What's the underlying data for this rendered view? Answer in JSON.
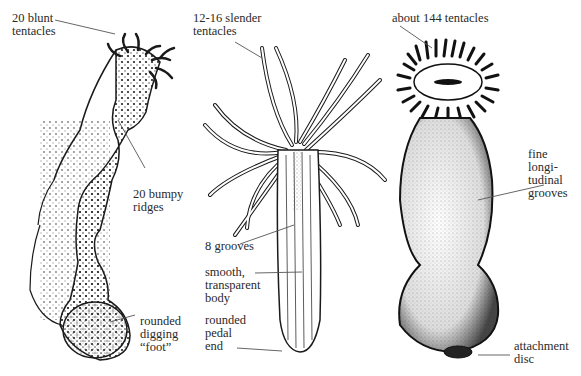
{
  "figure": {
    "kind": "sea anemone comparison illustration",
    "specimens": [
      {
        "id": "left",
        "labels": [
          {
            "key": "tentacles",
            "text": "20 blunt\ntentacles"
          },
          {
            "key": "ridges",
            "text": "20 bumpy\nridges"
          },
          {
            "key": "foot",
            "text": "rounded\ndigging\n“foot”"
          }
        ]
      },
      {
        "id": "middle",
        "labels": [
          {
            "key": "tentacles",
            "text": "12-16 slender\ntentacles"
          },
          {
            "key": "grooves",
            "text": "8 grooves"
          },
          {
            "key": "body",
            "text": "smooth,\ntransparent\nbody"
          },
          {
            "key": "pedal",
            "text": "rounded\npedal\nend"
          }
        ]
      },
      {
        "id": "right",
        "labels": [
          {
            "key": "tentacles",
            "text": "about 144 tentacles"
          },
          {
            "key": "grooves",
            "text": "fine\nlongi-\ntudinal\ngrooves"
          },
          {
            "key": "disc",
            "text": "attachment\ndisc"
          }
        ]
      }
    ]
  },
  "colors": {
    "ink": "#1a1a1a",
    "leader": "#555555",
    "background": "#ffffff"
  }
}
